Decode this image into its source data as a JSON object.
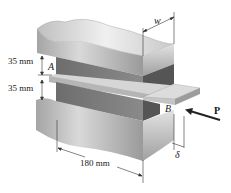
{
  "diagram": {
    "labels": {
      "top_gap": "35 mm",
      "bottom_gap": "35 mm",
      "point_a": "A",
      "point_b": "B",
      "width": "w",
      "force": "P",
      "displacement": "δ",
      "length": "180 mm"
    },
    "parts": [
      "upper-steel-plate",
      "upper-rubber-pad",
      "middle-plate",
      "lower-rubber-pad",
      "lower-steel-plate"
    ],
    "colors": {
      "steel_light": "#e6e6e6",
      "steel_mid": "#bdbdbd",
      "steel_dark": "#8f8f8f",
      "rubber_front": "#7a7a7a",
      "rubber_side": "#5e5e5e",
      "plate_top": "#d4d4d4",
      "plate_front": "#b0b0b0",
      "arrow": "#222222"
    }
  }
}
